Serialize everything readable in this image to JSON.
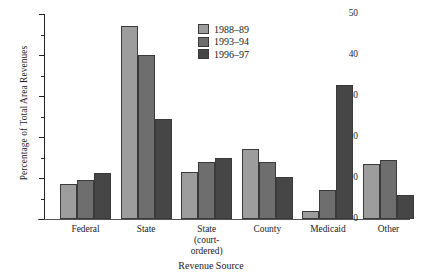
{
  "chart_data": {
    "type": "bar",
    "title": "",
    "xlabel": "Revenue Source",
    "ylabel": "Percentage of Total Area Revenues",
    "categories": [
      "Federal",
      "State",
      "State\n(court-\nordered)",
      "County",
      "Medicaid",
      "Other"
    ],
    "category_labels": [
      [
        "Federal"
      ],
      [
        "State"
      ],
      [
        "State",
        "(court-",
        "ordered)"
      ],
      [
        "County"
      ],
      [
        "Medicaid"
      ],
      [
        "Other"
      ]
    ],
    "series": [
      {
        "name": "1988–89",
        "color": "#9d9d9d",
        "values": [
          8.5,
          47.0,
          11.5,
          17.0,
          2.0,
          13.5
        ]
      },
      {
        "name": "1993–94",
        "color": "#6e6e6e",
        "values": [
          9.5,
          40.0,
          14.0,
          14.0,
          7.0,
          14.5
        ]
      },
      {
        "name": "1996–97",
        "color": "#464646",
        "values": [
          11.2,
          24.3,
          14.8,
          10.3,
          32.6,
          5.8
        ]
      }
    ],
    "ylim": [
      0,
      50
    ],
    "ytick_major": [
      0,
      10,
      20,
      30,
      40,
      50
    ],
    "ytick_major_labels": [
      "0",
      "10",
      "20",
      "30",
      "40",
      "50"
    ],
    "ytick_minor": [
      5,
      15,
      25,
      35,
      45
    ],
    "grid": false,
    "legend_position": "upper-center"
  }
}
